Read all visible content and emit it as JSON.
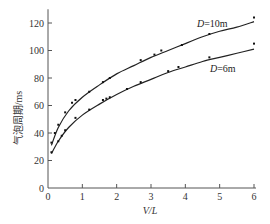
{
  "chart_data": {
    "type": "line",
    "title": "",
    "xlabel": "V/L",
    "ylabel": "气泡周期/ms",
    "xlim": [
      0,
      6
    ],
    "ylim": [
      0,
      130
    ],
    "xticks": [
      0,
      1,
      2,
      3,
      4,
      5,
      6
    ],
    "yticks": [
      0,
      20,
      40,
      60,
      80,
      100,
      120
    ],
    "grid": false,
    "legend_position": "inline labels on curves",
    "series": [
      {
        "name": "D=10m",
        "label_italic_part": "D",
        "label_rest": "=10m",
        "points": [
          {
            "x": 0.1,
            "y": 33
          },
          {
            "x": 0.2,
            "y": 40
          },
          {
            "x": 0.3,
            "y": 46
          },
          {
            "x": 0.5,
            "y": 55
          },
          {
            "x": 0.7,
            "y": 62
          },
          {
            "x": 0.8,
            "y": 64
          },
          {
            "x": 1.2,
            "y": 70
          },
          {
            "x": 1.6,
            "y": 77
          },
          {
            "x": 1.8,
            "y": 80
          },
          {
            "x": 2.7,
            "y": 93
          },
          {
            "x": 3.1,
            "y": 97
          },
          {
            "x": 3.3,
            "y": 100
          },
          {
            "x": 3.9,
            "y": 104
          },
          {
            "x": 4.7,
            "y": 112
          },
          {
            "x": 6.0,
            "y": 124
          }
        ],
        "fit_curve": [
          {
            "x": 0.1,
            "y": 31
          },
          {
            "x": 0.3,
            "y": 44
          },
          {
            "x": 0.6,
            "y": 56
          },
          {
            "x": 1.0,
            "y": 66
          },
          {
            "x": 1.5,
            "y": 75
          },
          {
            "x": 2.0,
            "y": 83
          },
          {
            "x": 2.5,
            "y": 89
          },
          {
            "x": 3.0,
            "y": 95
          },
          {
            "x": 3.5,
            "y": 100
          },
          {
            "x": 4.0,
            "y": 105
          },
          {
            "x": 4.5,
            "y": 110
          },
          {
            "x": 5.0,
            "y": 114
          },
          {
            "x": 5.5,
            "y": 117
          },
          {
            "x": 6.0,
            "y": 121
          }
        ]
      },
      {
        "name": "D=6m",
        "label_italic_part": "D",
        "label_rest": "=6m",
        "points": [
          {
            "x": 0.1,
            "y": 26
          },
          {
            "x": 0.3,
            "y": 34
          },
          {
            "x": 0.4,
            "y": 38
          },
          {
            "x": 0.5,
            "y": 42
          },
          {
            "x": 0.8,
            "y": 51
          },
          {
            "x": 1.2,
            "y": 57
          },
          {
            "x": 1.6,
            "y": 64
          },
          {
            "x": 1.7,
            "y": 65
          },
          {
            "x": 1.8,
            "y": 66
          },
          {
            "x": 2.3,
            "y": 72
          },
          {
            "x": 2.7,
            "y": 77
          },
          {
            "x": 3.5,
            "y": 85
          },
          {
            "x": 3.8,
            "y": 88
          },
          {
            "x": 4.7,
            "y": 95
          },
          {
            "x": 6.0,
            "y": 105
          }
        ],
        "fit_curve": [
          {
            "x": 0.1,
            "y": 25
          },
          {
            "x": 0.3,
            "y": 34
          },
          {
            "x": 0.6,
            "y": 44
          },
          {
            "x": 1.0,
            "y": 53
          },
          {
            "x": 1.5,
            "y": 61
          },
          {
            "x": 2.0,
            "y": 68
          },
          {
            "x": 2.5,
            "y": 74
          },
          {
            "x": 3.0,
            "y": 79
          },
          {
            "x": 3.5,
            "y": 84
          },
          {
            "x": 4.0,
            "y": 88
          },
          {
            "x": 4.5,
            "y": 92
          },
          {
            "x": 5.0,
            "y": 95
          },
          {
            "x": 5.5,
            "y": 98
          },
          {
            "x": 6.0,
            "y": 101
          }
        ]
      }
    ]
  },
  "axes": {
    "x_label": "V/L",
    "y_label": "气泡周期/ms"
  },
  "labels": {
    "series_10": {
      "italic": "D",
      "rest": "=10m"
    },
    "series_6": {
      "italic": "D",
      "rest": "=6m"
    }
  },
  "style": {
    "line_color": "#222222",
    "axis_color": "#555555",
    "marker_color": "#111111",
    "background": "#ffffff"
  }
}
